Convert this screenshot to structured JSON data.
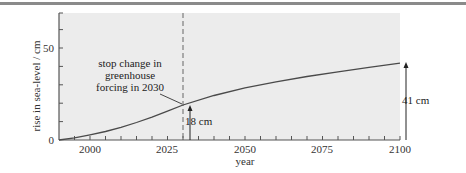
{
  "chart_data": {
    "type": "line",
    "title": "",
    "xlabel": "year",
    "ylabel": "rise in sea-level / cm",
    "xlim": [
      1990,
      2100
    ],
    "ylim": [
      0,
      69
    ],
    "x_ticks_major": [
      2000,
      2025,
      2050,
      2075,
      2100
    ],
    "x_tick_step_minor": 5,
    "y_ticks_labeled": [
      0,
      50
    ],
    "y_tick_step_minor": 10,
    "grid": false,
    "legend": null,
    "series": [
      {
        "name": "sea-level rise",
        "x": [
          1990,
          1995,
          2000,
          2005,
          2010,
          2015,
          2020,
          2025,
          2030,
          2040,
          2050,
          2060,
          2070,
          2080,
          2090,
          2100
        ],
        "values": [
          0,
          1.2,
          2.8,
          4.6,
          6.9,
          9.5,
          12.4,
          15.7,
          19.0,
          24.2,
          28.3,
          31.6,
          34.5,
          37.0,
          39.5,
          41.8
        ]
      }
    ],
    "annotations": [
      {
        "type": "vline-dashed",
        "x": 2030,
        "label": [
          "stop change in",
          "greenhouse",
          "forcing in 2030"
        ]
      },
      {
        "type": "arrow",
        "x": 2032,
        "from": 0,
        "to": 18,
        "label": "18 cm"
      },
      {
        "type": "arrow",
        "x": 2102,
        "from": 0,
        "to": 41,
        "label": "41 cm"
      }
    ]
  },
  "axis": {
    "x_label": "year",
    "y_label": "rise in sea-level / cm",
    "x_tick_labels": [
      "2000",
      "2025",
      "2050",
      "2075",
      "2100"
    ],
    "y_tick_labels": [
      "0",
      "50"
    ]
  },
  "annotations": {
    "forcing_line1": "stop change in",
    "forcing_line2": "greenhouse",
    "forcing_line3": "forcing in 2030",
    "arrow_2030": "18 cm",
    "arrow_2100": "41 cm"
  },
  "colors": {
    "plot_bg": "#ececec",
    "line": "#4a4a4a",
    "axis": "#555555",
    "top_rule": "#8a8a8a"
  }
}
